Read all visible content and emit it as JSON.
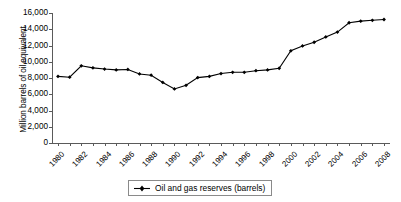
{
  "chart_data": {
    "type": "line",
    "title": "",
    "xlabel": "",
    "ylabel": "Million barrels of oil equivalent",
    "ylim": [
      0,
      16000
    ],
    "xlim": [
      1980,
      2008
    ],
    "grid": false,
    "legend_position": "bottom-center",
    "ytick_labels": [
      "16,000",
      "14,000",
      "12,000",
      "10,000",
      "8,000",
      "6,000",
      "4,000",
      "2,000",
      "0"
    ],
    "ytick_values": [
      16000,
      14000,
      12000,
      10000,
      8000,
      6000,
      4000,
      2000,
      0
    ],
    "xtick_labels": [
      "1980",
      "1982",
      "1984",
      "1986",
      "1988",
      "1990",
      "1992",
      "1994",
      "1996",
      "1998",
      "2000",
      "2002",
      "2004",
      "2006",
      "2008"
    ],
    "xtick_values": [
      1980,
      1982,
      1984,
      1986,
      1988,
      1990,
      1992,
      1994,
      1996,
      1998,
      2000,
      2002,
      2004,
      2006,
      2008
    ],
    "x": [
      1980,
      1981,
      1982,
      1983,
      1984,
      1985,
      1986,
      1987,
      1988,
      1989,
      1990,
      1991,
      1992,
      1993,
      1994,
      1995,
      1996,
      1997,
      1998,
      1999,
      2000,
      2001,
      2002,
      2003,
      2004,
      2005,
      2006,
      2007,
      2008
    ],
    "series": [
      {
        "name": "Oil and gas reserves  (barrels)",
        "marker": "diamond",
        "color": "#000000",
        "values": [
          8200,
          8100,
          9500,
          9250,
          9100,
          9000,
          9050,
          8500,
          8350,
          7450,
          6650,
          7100,
          8050,
          8200,
          8550,
          8700,
          8700,
          8900,
          9000,
          9200,
          11350,
          11950,
          12400,
          13050,
          13650,
          14800,
          15000,
          15100,
          15200
        ]
      }
    ]
  },
  "legend": {
    "entries": [
      {
        "label": "Oil and gas reserves  (barrels)"
      }
    ]
  }
}
